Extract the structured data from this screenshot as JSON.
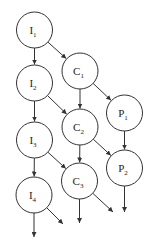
{
  "diagram": {
    "type": "directed-graph",
    "colors": {
      "stroke": "#333333",
      "text": "#222222",
      "background": "#ffffff"
    },
    "node_radius": 18,
    "nodes": [
      {
        "id": "I1",
        "base": "I",
        "sub": "1",
        "x": 34.5,
        "y": 30
      },
      {
        "id": "I2",
        "base": "I",
        "sub": "2",
        "x": 34.5,
        "y": 83
      },
      {
        "id": "I3",
        "base": "I",
        "sub": "3",
        "x": 34.5,
        "y": 140
      },
      {
        "id": "I4",
        "base": "I",
        "sub": "4",
        "x": 34,
        "y": 195
      },
      {
        "id": "C1",
        "base": "C",
        "sub": "1",
        "x": 80,
        "y": 71
      },
      {
        "id": "C2",
        "base": "C",
        "sub": "2",
        "x": 80,
        "y": 127
      },
      {
        "id": "C3",
        "base": "C",
        "sub": "3",
        "x": 79.5,
        "y": 181
      },
      {
        "id": "P1",
        "base": "P",
        "sub": "1",
        "x": 124.5,
        "y": 113
      },
      {
        "id": "P2",
        "base": "P",
        "sub": "2",
        "x": 124.5,
        "y": 168
      }
    ],
    "edges": [
      {
        "from": "I1",
        "to": "I2"
      },
      {
        "from": "I2",
        "to": "I3"
      },
      {
        "from": "I3",
        "to": "I4"
      },
      {
        "from": "I1",
        "to": "C1"
      },
      {
        "from": "I2",
        "to": "C2"
      },
      {
        "from": "I3",
        "to": "C3"
      },
      {
        "from": "C1",
        "to": "C2"
      },
      {
        "from": "C2",
        "to": "C3"
      },
      {
        "from": "C1",
        "to": "P1"
      },
      {
        "from": "C2",
        "to": "P2"
      },
      {
        "from": "P1",
        "to": "P2"
      }
    ],
    "dangling_edges": [
      {
        "from": "I4",
        "to_x": 34,
        "to_y": 237
      },
      {
        "from": "I4",
        "to_x": 63,
        "to_y": 224
      },
      {
        "from": "C3",
        "to_x": 79.5,
        "to_y": 223
      },
      {
        "from": "C3",
        "to_x": 113,
        "to_y": 212
      },
      {
        "from": "P2",
        "to_x": 124.5,
        "to_y": 212
      }
    ]
  }
}
